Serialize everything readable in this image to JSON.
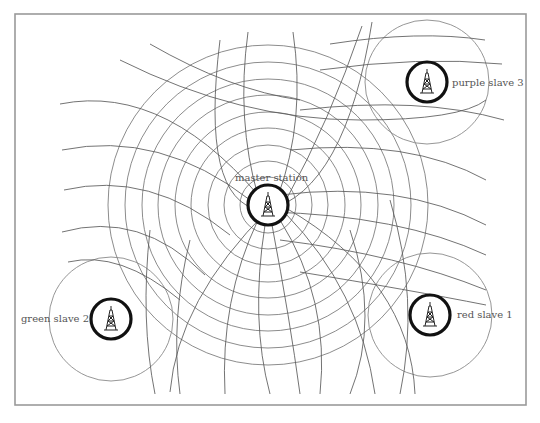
{
  "diagram": {
    "title": "",
    "frame": {
      "x": 15,
      "y": 14,
      "width": 511,
      "height": 391,
      "color": "#9a9a9a"
    },
    "colors": {
      "ring": "#6e6e6e",
      "hyperbola": "#5a5a5a",
      "station": "#111111",
      "label": "#555555"
    },
    "stations": [
      {
        "id": "master",
        "label": "master station",
        "cx": 268,
        "cy": 205,
        "r": 20,
        "label_x": 235,
        "label_y": 181,
        "anchor": "start"
      },
      {
        "id": "purple",
        "label": "purple slave 3",
        "cx": 427,
        "cy": 82,
        "r": 20,
        "label_x": 452,
        "label_y": 86,
        "anchor": "start"
      },
      {
        "id": "green",
        "label": "green slave 2",
        "cx": 111,
        "cy": 319,
        "r": 20,
        "label_x": 89,
        "label_y": 322,
        "anchor": "end"
      },
      {
        "id": "red",
        "label": "red slave 1",
        "cx": 430,
        "cy": 315,
        "r": 20,
        "label_x": 457,
        "label_y": 318,
        "anchor": "start"
      }
    ],
    "master_rings": [
      28,
      44,
      60,
      77,
      93,
      110,
      126,
      143,
      160
    ],
    "slave_halos": [
      {
        "cx": 427,
        "cy": 82,
        "r": 62
      },
      {
        "cx": 111,
        "cy": 319,
        "r": 62
      },
      {
        "cx": 430,
        "cy": 315,
        "r": 62
      }
    ],
    "hyperbolas": [
      "M 60 104 Q 170 82 272 212",
      "M 62 150 Q 160 130 250 200",
      "M 64 190 Q 150 170 230 235",
      "M 62 232 Q 140 210 205 275",
      "M 68 262 Q 120 250 180 300",
      "M 330 44 Q 420 30 485 40",
      "M 320 70 Q 420 56 502 64",
      "M 300 110 Q 420 96 504 120",
      "M 290 150 Q 410 138 486 180",
      "M 280 195 Q 400 180 486 225",
      "M 268 212 Q 400 215 486 255",
      "M 280 240 Q 400 255 486 290",
      "M 300 272 Q 410 290 486 305",
      "M 120 60 Q 240 120 360 120 Q 460 120 486 100",
      "M 150 44 Q 230 90 300 100",
      "M 220 40 Q 200 200 260 210",
      "M 248 32 Q 236 120 258 196",
      "M 293 32 Q 306 120 278 196",
      "M 362 26 Q 330 120 286 200",
      "M 372 22 Q 345 190 268 210",
      "M 268 210 Q 178 300 170 392",
      "M 258 220 Q 220 300 225 394",
      "M 265 225 Q 250 320 270 394",
      "M 272 225 Q 290 320 300 394",
      "M 280 220 Q 330 300 320 394",
      "M 286 214 Q 360 290 375 394",
      "M 286 208 Q 410 280 415 394",
      "M 150 230 Q 140 320 155 394",
      "M 190 240 Q 170 320 180 394",
      "M 350 230 Q 380 320 350 394",
      "M 390 200 Q 420 300 400 394"
    ]
  }
}
